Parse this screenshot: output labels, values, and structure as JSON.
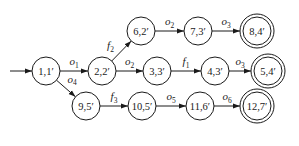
{
  "diagram": {
    "type": "state-transition-graph",
    "start_node": "n1",
    "nodes": [
      {
        "id": "n1",
        "label": "1,1′",
        "accepting": false
      },
      {
        "id": "n2",
        "label": "2,2′",
        "accepting": false
      },
      {
        "id": "n6",
        "label": "6,2′",
        "accepting": false
      },
      {
        "id": "n7",
        "label": "7,3′",
        "accepting": false
      },
      {
        "id": "n8",
        "label": "8,4′",
        "accepting": true
      },
      {
        "id": "n3",
        "label": "3,3′",
        "accepting": false
      },
      {
        "id": "n4",
        "label": "4,3′",
        "accepting": false
      },
      {
        "id": "n5",
        "label": "5,4′",
        "accepting": true
      },
      {
        "id": "n9",
        "label": "9,5′",
        "accepting": false
      },
      {
        "id": "n10",
        "label": "10,5′",
        "accepting": false
      },
      {
        "id": "n11",
        "label": "11,6′",
        "accepting": false
      },
      {
        "id": "n12",
        "label": "12,7′",
        "accepting": true
      }
    ],
    "edges": [
      {
        "from": "n1",
        "to": "n2",
        "symbol": "o",
        "sub": "1"
      },
      {
        "from": "n1",
        "to": "n9",
        "symbol": "o",
        "sub": "4"
      },
      {
        "from": "n2",
        "to": "n6",
        "symbol": "f",
        "sub": "2"
      },
      {
        "from": "n2",
        "to": "n3",
        "symbol": "o",
        "sub": "2"
      },
      {
        "from": "n6",
        "to": "n7",
        "symbol": "o",
        "sub": "2"
      },
      {
        "from": "n7",
        "to": "n8",
        "symbol": "o",
        "sub": "3"
      },
      {
        "from": "n3",
        "to": "n4",
        "symbol": "f",
        "sub": "1"
      },
      {
        "from": "n4",
        "to": "n5",
        "symbol": "o",
        "sub": "3"
      },
      {
        "from": "n9",
        "to": "n10",
        "symbol": "f",
        "sub": "3"
      },
      {
        "from": "n10",
        "to": "n11",
        "symbol": "o",
        "sub": "5"
      },
      {
        "from": "n11",
        "to": "n12",
        "symbol": "o",
        "sub": "6"
      }
    ]
  }
}
